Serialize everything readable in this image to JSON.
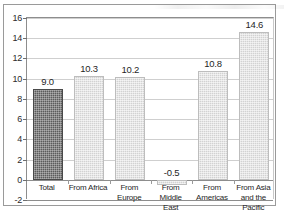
{
  "chart_data": {
    "type": "bar",
    "title": "",
    "subtitle": "",
    "xlabel": "",
    "ylabel": "",
    "categories": [
      "Total",
      "From Africa",
      "From Europe",
      "From Middle\nEast",
      "From\nAmericas",
      "From Asia\nand the\nPacific"
    ],
    "values": [
      9.0,
      10.3,
      10.2,
      -0.5,
      10.8,
      14.6
    ],
    "data_labels": [
      "9.0",
      "10.3",
      "10.2",
      "-0.5",
      "10.8",
      "14.6"
    ],
    "ylim": [
      -2,
      16
    ],
    "ytick_values": [
      16,
      14,
      12,
      10,
      8,
      6,
      4,
      2,
      0,
      -2
    ],
    "ytick_labels": [
      "16",
      "14",
      "12",
      "10",
      "8",
      "6",
      "4",
      "2",
      "0",
      "-2"
    ],
    "grid": true,
    "legend": "none",
    "series": [
      {
        "name": "",
        "values": [
          9.0,
          10.3,
          10.2,
          -0.5,
          10.8,
          14.6
        ]
      }
    ],
    "bar_colors": [
      "#5b5b5b",
      "#d2d2d2",
      "#d2d2d2",
      "#d2d2d2",
      "#d2d2d2",
      "#d2d2d2"
    ],
    "colors": {
      "highlight_bar": "#5b5b5b",
      "standard_bar": "#d2d2d2",
      "gridline": "#cfcfcf",
      "axis": "#8d8d8d",
      "text": "#1f1f1f",
      "background": "#ffffff"
    }
  }
}
